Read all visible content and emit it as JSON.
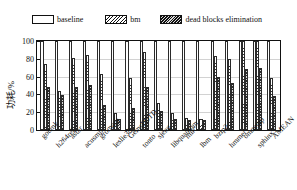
{
  "chart_data": {
    "type": "bar",
    "title": "",
    "xlabel": "",
    "ylabel": "功耗/%",
    "ylim": [
      0,
      100
    ],
    "yticks": [
      0,
      20,
      40,
      60,
      80,
      100
    ],
    "grid": true,
    "legend_position": "top",
    "categories": [
      "gobmk",
      "h264ref",
      "astar",
      "acusmp",
      "gromacs",
      "leslie3d",
      "GemsFDTD",
      "tonto",
      "sjeng",
      "libquantum",
      "milc",
      "lbm",
      "bzip2",
      "hmmer",
      "omnetpp",
      "sphinx3",
      "AMEAN"
    ],
    "series": [
      {
        "name": "baseline",
        "values": [
          100,
          100,
          100,
          100,
          100,
          100,
          100,
          100,
          100,
          100,
          100,
          100,
          100,
          100,
          100,
          100,
          100
        ]
      },
      {
        "name": "bm",
        "values": [
          74,
          44,
          81,
          84,
          63,
          19,
          59,
          88,
          30,
          19,
          14,
          12,
          83,
          80,
          100,
          100,
          58
        ]
      },
      {
        "name": "dead blocks elimination",
        "values": [
          48,
          39,
          48,
          51,
          28,
          12,
          25,
          48,
          21,
          12,
          11,
          11,
          60,
          53,
          68,
          70,
          38
        ]
      }
    ]
  },
  "legend": {
    "items": [
      {
        "label": "baseline",
        "pattern": "empty",
        "color": "#ffffff"
      },
      {
        "label": "bm",
        "pattern": "light-hatch",
        "color": "#333333"
      },
      {
        "label": "dead blocks elimination",
        "pattern": "dense-hatch",
        "color": "#2b2b2b"
      }
    ]
  },
  "axis": {
    "y_label": "功耗/%",
    "y_ticks": [
      "0",
      "20",
      "40",
      "60",
      "80",
      "100"
    ]
  }
}
